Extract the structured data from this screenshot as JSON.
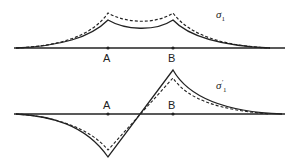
{
  "diagram": {
    "top_panel": {
      "label": "σ",
      "subscript": "1",
      "points": [
        "A",
        "B"
      ],
      "curves": [
        "solid",
        "dashed"
      ]
    },
    "bottom_panel": {
      "label": "σ",
      "prime": "′",
      "subscript": "1",
      "points": [
        "A",
        "B"
      ],
      "curves": [
        "solid",
        "dashed"
      ]
    },
    "colors": {
      "line": "#222222",
      "background": "#ffffff"
    }
  }
}
